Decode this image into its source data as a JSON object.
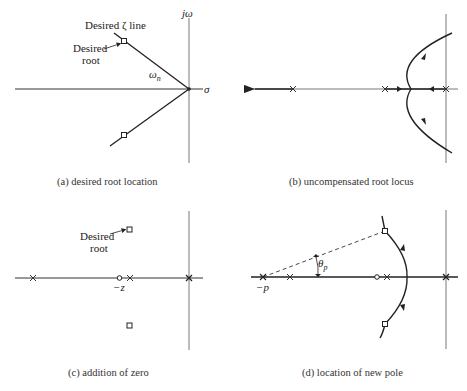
{
  "panels": [
    {
      "id": "a",
      "caption": "(a) desired root location",
      "labels": {
        "zeta_line": "Desired ζ line",
        "desired_root_1": "Desired",
        "desired_root_2": "root",
        "omega_n": "ω",
        "omega_n_sub": "n",
        "j_omega": "jω",
        "sigma": "σ"
      }
    },
    {
      "id": "b",
      "caption": "(b) uncompensated root locus"
    },
    {
      "id": "c",
      "caption": "(c) addition of zero",
      "labels": {
        "desired_root_1": "Desired",
        "desired_root_2": "root",
        "zero": "−z"
      }
    },
    {
      "id": "d",
      "caption": "(d) location of new pole",
      "labels": {
        "theta_p": "θ",
        "theta_p_sub": "p",
        "pole": "−p"
      }
    }
  ],
  "colors": {
    "line": "#222222",
    "axis": "#555555"
  }
}
